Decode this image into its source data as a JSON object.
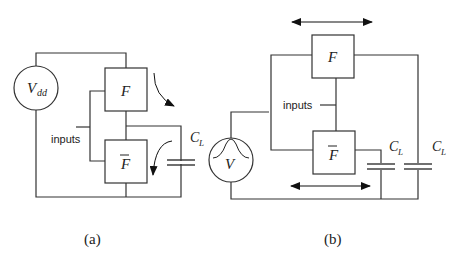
{
  "figure": {
    "panels": [
      {
        "id": "a",
        "caption": "(a)",
        "source_label": "V",
        "source_subscript": "dd",
        "block_top": "F",
        "block_bottom": "F",
        "block_bottom_overbar": true,
        "inputs_label": "inputs",
        "capacitor_label": "C",
        "capacitor_subscript": "L",
        "arrows": [
          "curved-arrow-charging",
          "curved-arrow-discharging"
        ]
      },
      {
        "id": "b",
        "caption": "(b)",
        "source_label": "V",
        "source_symbol": "gaussian-pulse",
        "block_top": "F",
        "block_bottom": "F",
        "block_bottom_overbar": true,
        "inputs_label": "inputs",
        "capacitors": [
          {
            "label": "C",
            "subscript": "L"
          },
          {
            "label": "C",
            "subscript": "L"
          }
        ],
        "arrows": [
          "double-headed-arrow-top",
          "double-headed-arrow-bottom"
        ]
      }
    ]
  }
}
